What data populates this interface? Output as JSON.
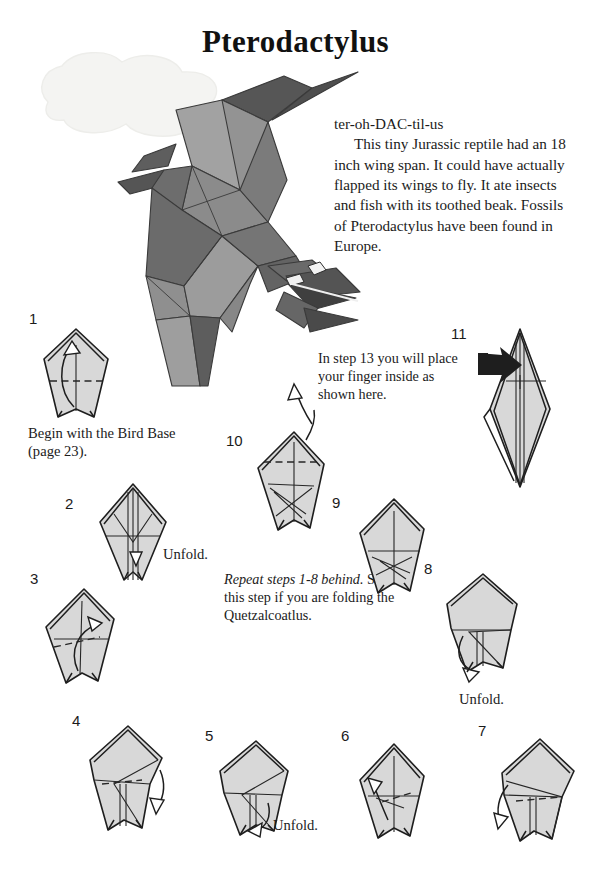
{
  "page": {
    "title": "Pterodactylus",
    "width": 591,
    "height": 883,
    "background": "#ffffff"
  },
  "description": {
    "pronunciation": "ter-oh-DAC-til-us",
    "body": "This tiny Jurassic reptile had an 18 inch wing span.  It could have actually flapped its wings to fly.  It ate insects and fish with its toothed beak.  Fossils of Pterodactylus have been found in Europe."
  },
  "model": {
    "name": "pterodactylus-origami-model",
    "colors": {
      "light": "#a9a9a9",
      "mid": "#8f8f8f",
      "dark": "#6e6e6e",
      "darker": "#565656",
      "outline": "#3a3a3a",
      "cloud": "#f4f4f2"
    }
  },
  "notes": {
    "step13": "In step 13 you will place your finger inside as shown here.",
    "repeat_italic": "Repeat steps 1-8 behind.",
    "repeat_rest": "  Skip this step if you are folding the Quetzalcoatlus."
  },
  "captions": {
    "step1": "Begin with the Bird Base (page 23).",
    "step2": "Unfold.",
    "step5": "Unfold.",
    "step8": "Unfold."
  },
  "steps": [
    {
      "number": "1",
      "name": "step-1-diagram"
    },
    {
      "number": "2",
      "name": "step-2-diagram"
    },
    {
      "number": "3",
      "name": "step-3-diagram"
    },
    {
      "number": "4",
      "name": "step-4-diagram"
    },
    {
      "number": "5",
      "name": "step-5-diagram"
    },
    {
      "number": "6",
      "name": "step-6-diagram"
    },
    {
      "number": "7",
      "name": "step-7-diagram"
    },
    {
      "number": "8",
      "name": "step-8-diagram"
    },
    {
      "number": "9",
      "name": "step-9-diagram"
    },
    {
      "number": "10",
      "name": "step-10-diagram"
    },
    {
      "number": "11",
      "name": "step-11-diagram"
    }
  ]
}
